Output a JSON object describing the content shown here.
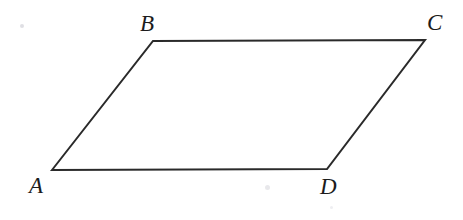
{
  "figure": {
    "kind": "parallelogram",
    "name": "parallelogram-ABCD",
    "canvas": {
      "width": 463,
      "height": 220
    },
    "background_color": "#ffffff",
    "stroke_color": "#2a2a2a",
    "stroke_width": 2,
    "fill": "none",
    "vertices": [
      {
        "id": "A",
        "label": "A",
        "x": 52,
        "y": 170,
        "label_x": 29,
        "label_y": 174
      },
      {
        "id": "B",
        "label": "B",
        "x": 153,
        "y": 41,
        "label_x": 140,
        "label_y": 12
      },
      {
        "id": "C",
        "label": "C",
        "x": 425,
        "y": 40,
        "label_x": 427,
        "label_y": 11
      },
      {
        "id": "D",
        "label": "D",
        "x": 327,
        "y": 169,
        "label_x": 320,
        "label_y": 175
      }
    ],
    "edges": [
      {
        "id": "AB",
        "from": "A",
        "to": "B",
        "label": ""
      },
      {
        "id": "BC",
        "from": "B",
        "to": "C",
        "label": ""
      },
      {
        "id": "CD",
        "from": "C",
        "to": "D",
        "label": ""
      },
      {
        "id": "DA",
        "from": "D",
        "to": "A",
        "label": ""
      }
    ],
    "path_points": "52,170 153,41 425,40 327,169",
    "marks": [
      {
        "id": "speck-1",
        "x": 20,
        "y": 24,
        "size": 4,
        "color": "rgba(150,150,165,0.30)"
      },
      {
        "id": "speck-2",
        "x": 265,
        "y": 185,
        "size": 5,
        "color": "rgba(150,150,165,0.22)"
      },
      {
        "id": "speck-3",
        "x": 330,
        "y": 206,
        "size": 3,
        "color": "rgba(150,150,165,0.16)"
      }
    ]
  }
}
